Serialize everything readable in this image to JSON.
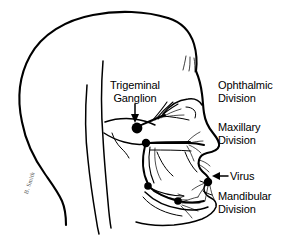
{
  "figure": {
    "background_color": "#ffffff",
    "ink_color": "#000000",
    "signature": "B. Smith"
  },
  "labels": {
    "trigeminal_ganglion": "Trigeminal\nGanglion",
    "ophthalmic_division": "Ophthalmic\nDivision",
    "maxillary_division": "Maxillary\nDivision",
    "virus": "Virus",
    "mandibular_division": "Mandibular\nDivision"
  },
  "nodes": [
    {
      "name": "trigeminal-ganglion-node",
      "x": 137,
      "y": 128,
      "r": 5.4
    },
    {
      "name": "maxillary-node",
      "x": 146,
      "y": 143,
      "r": 4.2
    },
    {
      "name": "mandibular-upper-node",
      "x": 148,
      "y": 186,
      "r": 3.8
    },
    {
      "name": "mandibular-lower-node",
      "x": 178,
      "y": 201,
      "r": 3.8
    },
    {
      "name": "virus-lip-node",
      "x": 208,
      "y": 182,
      "r": 4.2
    }
  ],
  "pointers": [
    {
      "name": "trigeminal-pointer",
      "direction": "down",
      "from_x": 135,
      "from_y": 104,
      "to_x": 135,
      "to_y": 120
    },
    {
      "name": "virus-pointer",
      "direction": "left",
      "from_x": 227,
      "from_y": 176,
      "to_x": 213,
      "to_y": 176
    }
  ]
}
